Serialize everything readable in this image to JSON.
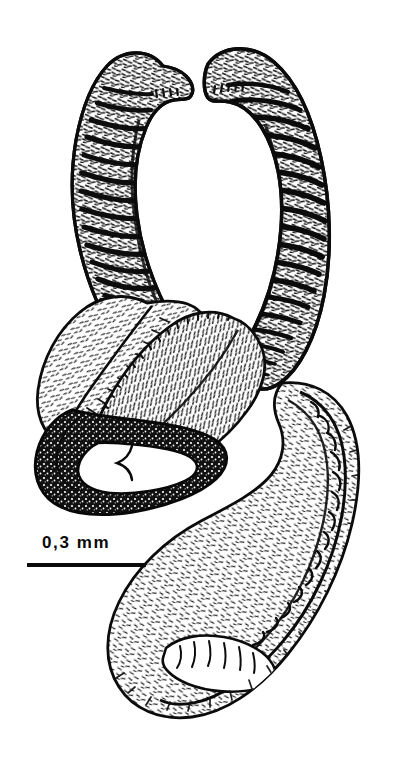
{
  "figure": {
    "type": "scientific-line-drawing",
    "background_color": "#ffffff",
    "ink_color": "#101010",
    "caption_text": "",
    "width": 414,
    "height": 762
  },
  "scale": {
    "label": "0,3 mm",
    "value": "0,3",
    "unit": "mm",
    "bar_length_px": 119,
    "bar_x": 27,
    "bar_y": 563,
    "label_x": 42,
    "label_y": 533,
    "color": "#0a0a0a"
  },
  "parts": [
    {
      "id": "left-arm",
      "name": "left annulated arm",
      "description": "curved sickle-shaped arm with transverse dark annulations, apex hooked inward at top",
      "bands": 17,
      "shading": "dense-transverse-bands"
    },
    {
      "id": "right-arm",
      "name": "right annulated arm",
      "description": "larger mirrored sickle-shaped arm with transverse dark annulations, apex hooked inward at top",
      "bands": 19,
      "shading": "dense-transverse-bands"
    },
    {
      "id": "left-lobe",
      "name": "left membranous lobe",
      "description": "broad oval lobe with fine stipple hatching and fringed lower margin",
      "shading": "fine-stipple"
    },
    {
      "id": "median-lobe",
      "name": "median hairy lobe",
      "description": "central lobe densely covered with short setae",
      "shading": "dense-setae"
    },
    {
      "id": "sclerotized-loop",
      "name": "sclerotized loop",
      "description": "dark heavily sclerotized ring-shaped structure at lower left enclosing a pale lumen",
      "shading": "solid-black-granular"
    },
    {
      "id": "descending-lobe",
      "name": "descending elongate lobe",
      "description": "long curved lobe extending to the bottom of the figure, with a toothed inner ridge and a small denticulate pocket near the tip",
      "shading": "fine-stipple-with-setae"
    },
    {
      "id": "toothed-ridge",
      "name": "toothed inner ridge",
      "description": "row of spine-like teeth along the inner margin of the descending lobe",
      "teeth": 16
    }
  ]
}
